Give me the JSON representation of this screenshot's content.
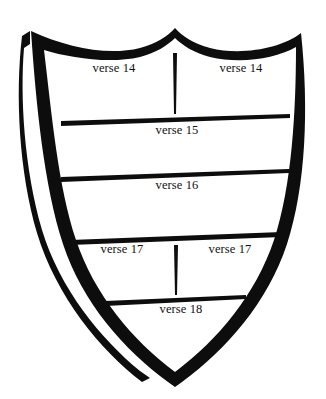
{
  "figure": {
    "kind": "heraldic-shield-diagram",
    "background_color": "#ffffff",
    "ink_color": "#111111",
    "outline_color": "#0d0d0d"
  },
  "shield": {
    "name": "shield-outline",
    "left_edge_style": "thick-band",
    "right_edge_style": "thin-stroke",
    "shadow_offset": "left-outer-band",
    "top_style": "double-scalloped-with-center-peak",
    "bottom_style": "pointed-tip"
  },
  "sections": [
    {
      "id": "row-14",
      "labels": [
        {
          "text": "verse 14",
          "x": 114,
          "y": 68
        },
        {
          "text": "verse 14",
          "x": 241,
          "y": 68
        }
      ],
      "divider": {
        "name": "vertical-divider-top",
        "x": 175,
        "y1": 53,
        "y2": 114
      }
    },
    {
      "id": "row-15",
      "rule": {
        "name": "horizontal-rule-verse-15",
        "x1": 61,
        "y1": 124,
        "x2": 290,
        "y2": 117
      },
      "labels": [
        {
          "text": "verse 15",
          "x": 177,
          "y": 132
        }
      ]
    },
    {
      "id": "row-16",
      "rule": {
        "name": "horizontal-rule-verse-16",
        "x1": 61,
        "y1": 180,
        "x2": 289,
        "y2": 172
      },
      "labels": [
        {
          "text": "verse 16",
          "x": 177,
          "y": 187
        }
      ]
    },
    {
      "id": "row-17",
      "rule": {
        "name": "horizontal-rule-verse-17",
        "x1": 70,
        "y1": 243,
        "x2": 282,
        "y2": 236
      },
      "labels": [
        {
          "text": "verse 17",
          "x": 122,
          "y": 250
        },
        {
          "text": "verse 17",
          "x": 230,
          "y": 250
        }
      ],
      "divider": {
        "name": "vertical-divider-bottom",
        "x": 176,
        "y1": 245,
        "y2": 295
      }
    },
    {
      "id": "row-18",
      "rule": {
        "name": "horizontal-rule-verse-18",
        "x1": 105,
        "y1": 303,
        "x2": 246,
        "y2": 298
      },
      "labels": [
        {
          "text": "verse 18",
          "x": 181,
          "y": 311
        }
      ]
    }
  ]
}
